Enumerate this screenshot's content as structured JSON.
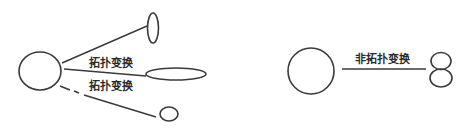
{
  "diagram": {
    "left_group": {
      "description": "Topological transformations of a circle",
      "source_shape": "circle",
      "targets": [
        {
          "shape": "tall-narrow-ellipse"
        },
        {
          "shape": "wide-flat-ellipse"
        },
        {
          "shape": "small-circle"
        }
      ],
      "labels": [
        {
          "text": "拓扑变换"
        },
        {
          "text": "拓扑变换"
        }
      ]
    },
    "right_group": {
      "description": "Non-topological transformation of a circle",
      "source_shape": "circle",
      "target_shape": "figure-eight",
      "label": {
        "text": "非拓扑变换"
      }
    }
  }
}
